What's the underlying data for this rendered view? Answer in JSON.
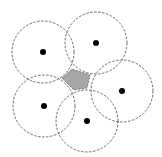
{
  "diagram": {
    "width": 162,
    "height": 157,
    "colors": {
      "background": "#ffffff",
      "circle_stroke": "#444444",
      "dot_fill": "#000000",
      "region_fill": "#a6a6a6",
      "region_stroke": "#555555"
    },
    "circles": [
      {
        "id": "top-left",
        "cx": 43,
        "cy": 52,
        "r": 31
      },
      {
        "id": "top-right",
        "cx": 96,
        "cy": 43,
        "r": 31
      },
      {
        "id": "right",
        "cx": 122,
        "cy": 91,
        "r": 31
      },
      {
        "id": "bottom-right",
        "cx": 87,
        "cy": 121,
        "r": 31
      },
      {
        "id": "bottom-left",
        "cx": 44,
        "cy": 106,
        "r": 31
      }
    ],
    "intersection_region": {
      "points": "62,78 72,69 90,75 87,88 74,90"
    }
  }
}
